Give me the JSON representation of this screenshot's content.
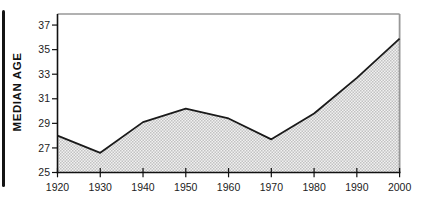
{
  "chart_data": {
    "type": "area",
    "title": "",
    "ylabel": "MEDIAN AGE",
    "xlabel": "",
    "categories": [
      "1920",
      "1930",
      "1940",
      "1950",
      "1960",
      "1970",
      "1980",
      "1990",
      "2000"
    ],
    "x": [
      1920,
      1930,
      1940,
      1950,
      1960,
      1970,
      1980,
      1990,
      2000
    ],
    "values": [
      28.0,
      26.6,
      29.1,
      30.2,
      29.4,
      27.7,
      29.8,
      32.7,
      35.9
    ],
    "series_name": "Median age",
    "yticks": [
      25,
      27,
      29,
      31,
      33,
      35,
      37
    ],
    "ylim": [
      25,
      37.9
    ],
    "xlim": [
      1920,
      2000
    ],
    "grid": false,
    "legend": "none",
    "fill_style": "halftone-dot-pattern",
    "colors": {
      "line": "#1a1a1a",
      "axis": "#111111",
      "frame": "#979797",
      "text": "#1c1c1c",
      "fill_bg": "#f1f1f1",
      "fill_dot": "#c2c2c2"
    }
  },
  "decorations": {
    "left_edge_bar_color": "#141414"
  }
}
